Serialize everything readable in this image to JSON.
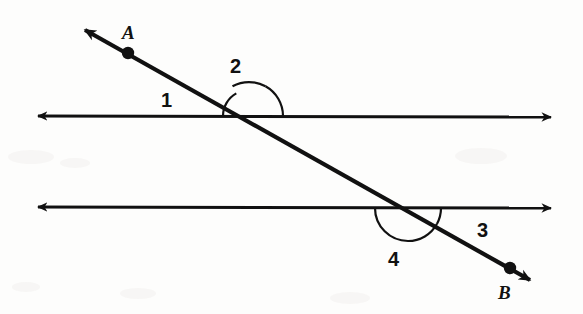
{
  "figure": {
    "kind": "geometry-diagram",
    "background_color": "#fdfdfc",
    "ink_color": "#111111",
    "width": 583,
    "height": 314
  },
  "points": [
    {
      "id": "A",
      "label": "A",
      "dot_x": 128,
      "dot_y": 53,
      "label_x": 122,
      "label_y": 23
    },
    {
      "id": "B",
      "label": "B",
      "dot_x": 510,
      "dot_y": 268,
      "label_x": 498,
      "label_y": 283
    }
  ],
  "lines": [
    {
      "id": "upper-parallel-line",
      "name": "upper horizontal line",
      "x1": 27,
      "y1": 116,
      "x2": 562,
      "y2": 117,
      "arrow_start": true,
      "arrow_end": true,
      "stroke_width": 3
    },
    {
      "id": "lower-parallel-line",
      "name": "lower horizontal line",
      "x1": 27,
      "y1": 207,
      "x2": 562,
      "y2": 208,
      "arrow_start": true,
      "arrow_end": true,
      "stroke_width": 3
    },
    {
      "id": "transversal-line",
      "name": "transversal through A and B",
      "x1": 74,
      "y1": 24,
      "x2": 541,
      "y2": 286,
      "arrow_start": true,
      "arrow_end": true,
      "stroke_width": 4
    }
  ],
  "intersections": [
    {
      "id": "upper-intersection",
      "x": 249,
      "y": 116
    },
    {
      "id": "lower-intersection",
      "x": 408,
      "y": 208
    }
  ],
  "angles": [
    {
      "id": "angle-1",
      "label": "1",
      "vertex": "upper-intersection",
      "position": "left of transversal, above upper line",
      "arc_radius": 26,
      "arc_start_deg": 180,
      "arc_end_deg": 119,
      "label_x": 161,
      "label_y": 90
    },
    {
      "id": "angle-2",
      "label": "2",
      "vertex": "upper-intersection",
      "position": "right of transversal, above upper line",
      "arc_radius": 34,
      "arc_start_deg": 119,
      "arc_end_deg": 0,
      "label_x": 230,
      "label_y": 56
    },
    {
      "id": "angle-3",
      "label": "3",
      "vertex": "lower-intersection",
      "position": "right of transversal, below lower line",
      "arc_radius": 33,
      "arc_start_deg": 0,
      "arc_end_deg": -29,
      "label_x": 477,
      "label_y": 220
    },
    {
      "id": "angle-4",
      "label": "4",
      "vertex": "lower-intersection",
      "position": "left of transversal, below lower line",
      "arc_radius": 33,
      "arc_start_deg": -29,
      "arc_end_deg": -180,
      "label_x": 388,
      "label_y": 249
    }
  ]
}
